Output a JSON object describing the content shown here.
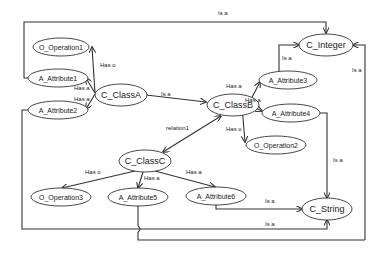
{
  "diagram": {
    "type": "ontology-class-diagram",
    "colors": {
      "stroke": "#333333",
      "background": "#ffffff",
      "text": "#1a1a1a"
    },
    "nodes": [
      {
        "id": "op1",
        "label": "O_Operation1",
        "kind": "operation",
        "cx": 61,
        "cy": 47,
        "rx": 28,
        "ry": 9
      },
      {
        "id": "attr1",
        "label": "A_Attribute1",
        "kind": "attribute",
        "cx": 58,
        "cy": 78,
        "rx": 30,
        "ry": 9
      },
      {
        "id": "attr2",
        "label": "A_Attribute2",
        "kind": "attribute",
        "cx": 58,
        "cy": 110,
        "rx": 30,
        "ry": 9
      },
      {
        "id": "classA",
        "label": "C_ClassA",
        "kind": "class",
        "cx": 121,
        "cy": 95,
        "rx": 26,
        "ry": 11
      },
      {
        "id": "classB",
        "label": "C_ClassB",
        "kind": "class",
        "cx": 233,
        "cy": 105,
        "rx": 26,
        "ry": 11
      },
      {
        "id": "integer",
        "label": "C_Integer",
        "kind": "class",
        "cx": 326,
        "cy": 45,
        "rx": 27,
        "ry": 11
      },
      {
        "id": "attr3",
        "label": "A_Attribute3",
        "kind": "attribute",
        "cx": 288,
        "cy": 80,
        "rx": 29,
        "ry": 9
      },
      {
        "id": "attr4",
        "label": "A_Attribute4",
        "kind": "attribute",
        "cx": 291,
        "cy": 113,
        "rx": 29,
        "ry": 9
      },
      {
        "id": "op2",
        "label": "O_Operation2",
        "kind": "operation",
        "cx": 276,
        "cy": 145,
        "rx": 30,
        "ry": 9
      },
      {
        "id": "classC",
        "label": "C_ClassC",
        "kind": "class",
        "cx": 145,
        "cy": 161,
        "rx": 26,
        "ry": 11
      },
      {
        "id": "op3",
        "label": "O_Operation3",
        "kind": "operation",
        "cx": 61,
        "cy": 197,
        "rx": 30,
        "ry": 9
      },
      {
        "id": "attr5",
        "label": "A_Attribute5",
        "kind": "attribute",
        "cx": 138,
        "cy": 197,
        "rx": 30,
        "ry": 9
      },
      {
        "id": "attr6",
        "label": "A_Attribute6",
        "kind": "attribute",
        "cx": 216,
        "cy": 196,
        "rx": 30,
        "ry": 9
      },
      {
        "id": "string",
        "label": "C_String",
        "kind": "class",
        "cx": 327,
        "cy": 209,
        "rx": 25,
        "ry": 11
      }
    ],
    "edges": [
      {
        "id": "e1",
        "from": "classA",
        "to": "op1",
        "label": "Has o",
        "lx": 100,
        "ly": 67,
        "points": "95,93 92,47",
        "arrow_end": true
      },
      {
        "id": "e2",
        "from": "classA",
        "to": "attr1",
        "label": "Has a",
        "lx": 74,
        "ly": 90,
        "points": "95,93 86,78",
        "arrow_end": true
      },
      {
        "id": "e3",
        "from": "classA",
        "to": "attr2",
        "label": "Has a",
        "lx": 74,
        "ly": 101,
        "points": "95,94 86,109",
        "arrow_end": true
      },
      {
        "id": "e4",
        "from": "classA",
        "to": "classB",
        "label": "Is a",
        "lx": 161,
        "ly": 96,
        "points": "146,95 206,102",
        "arrow_end": true
      },
      {
        "id": "e5",
        "from": "classB",
        "to": "classC",
        "label": "relation1",
        "lx": 166,
        "ly": 130,
        "points": "221,116 163,152",
        "arrow_end": true,
        "arrow_start": true
      },
      {
        "id": "e6",
        "from": "attr1",
        "to": "integer",
        "label": "Is a",
        "lx": 218,
        "ly": 15,
        "points": "28,78 24,78 24,22 326,22 326,33",
        "arrow_end": true
      },
      {
        "id": "e7",
        "from": "classB",
        "to": "attr3",
        "label": "Has a",
        "lx": 226,
        "ly": 88,
        "points": "249,103 260,82",
        "arrow_end": true
      },
      {
        "id": "e8",
        "from": "classB",
        "to": "attr4",
        "label": "Has a",
        "lx": 245,
        "ly": 102,
        "points": "249,105 262,111",
        "arrow_end": true
      },
      {
        "id": "e9",
        "from": "classB",
        "to": "op2",
        "label": "Has o",
        "lx": 226,
        "ly": 131,
        "points": "242,106 245,142",
        "arrow_end": true
      },
      {
        "id": "e10",
        "from": "attr3",
        "to": "integer",
        "label": "Is a",
        "lx": 282,
        "ly": 60,
        "points": "279,71 279,45 299,45",
        "arrow_end": true
      },
      {
        "id": "e11",
        "from": "string",
        "to": "integer",
        "label": "Is a",
        "lx": 352,
        "ly": 72,
        "points": "365,240 365,45 353,45",
        "arrow_end": true
      },
      {
        "id": "e12",
        "from": "attr4",
        "to": "string",
        "label": "Is a",
        "lx": 333,
        "ly": 162,
        "points": "320,113 327,113 327,198",
        "arrow_end": true
      },
      {
        "id": "e13",
        "from": "classC",
        "to": "op3",
        "label": "Has o",
        "lx": 85,
        "ly": 174,
        "points": "135,171 62,188",
        "arrow_end": true
      },
      {
        "id": "e14",
        "from": "classC",
        "to": "attr5",
        "label": "Has a",
        "lx": 144,
        "ly": 180,
        "points": "143,172 138,188",
        "arrow_end": true
      },
      {
        "id": "e15",
        "from": "classC",
        "to": "attr6",
        "label": "Has a",
        "lx": 186,
        "ly": 174,
        "points": "155,171 215,187",
        "arrow_end": true
      },
      {
        "id": "e16",
        "from": "attr6",
        "to": "string",
        "label": "Is a",
        "lx": 265,
        "ly": 203,
        "points": "216,205 216,209 302,209",
        "arrow_end": true
      },
      {
        "id": "e17",
        "from": "attr2",
        "to": "string",
        "label": "Is a",
        "lx": 265,
        "ly": 226,
        "points": "28,110 22,110 22,229 327,229 327,220",
        "arrow_end": true
      },
      {
        "id": "e18",
        "from": "attr5",
        "to": "integer",
        "label": "",
        "lx": 0,
        "ly": 0,
        "points": "138,206 138,226 M138,232 138,240 365,240",
        "arrow_end": false,
        "hop": true
      }
    ]
  }
}
